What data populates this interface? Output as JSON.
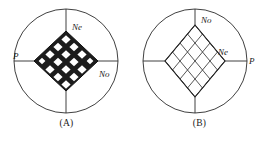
{
  "figure": {
    "panels": [
      {
        "id": "A",
        "caption": "(A)",
        "diamond_orientation": "horizontal",
        "diamond_style": "filled-dark-with-white-cells",
        "grid_cells": 16,
        "grid_rows": 4,
        "grid_cols": 4,
        "labels": {
          "left_axis": "P",
          "upper_right": "Ne",
          "lower_right": "No"
        }
      },
      {
        "id": "B",
        "caption": "(B)",
        "diamond_orientation": "vertical",
        "diamond_style": "outline-crosshatch",
        "grid_cells": 16,
        "grid_rows": 4,
        "grid_cols": 4,
        "labels": {
          "top_axis": "No",
          "inner_right": "Ne",
          "right_axis": "P"
        }
      }
    ]
  },
  "colors": {
    "stroke": "#2a2a2a",
    "fill_dark": "#1c1c1c",
    "fill_light": "#ffffff",
    "background": "#ffffff",
    "text": "#1a1a1a"
  }
}
